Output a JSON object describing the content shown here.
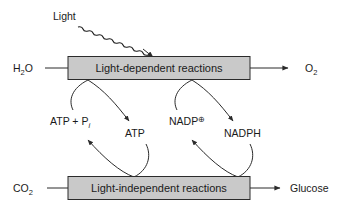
{
  "diagram": {
    "colors": {
      "box_fill": "#c9c9c9",
      "box_stroke": "#2b2b2b",
      "line": "#2b2b2b",
      "text": "#1a1a1a",
      "background": "#ffffff"
    },
    "light": {
      "label": "Light"
    },
    "boxes": [
      {
        "id": "light-dependent",
        "label": "Light-dependent reactions"
      },
      {
        "id": "light-independent",
        "label": "Light-independent reactions"
      }
    ],
    "inputs": [
      {
        "id": "water",
        "label_main": "H",
        "label_sub": "2",
        "label_tail": "O"
      },
      {
        "id": "carbon-dioxide",
        "label_main": "CO",
        "label_sub": "2",
        "label_tail": ""
      }
    ],
    "outputs": [
      {
        "id": "oxygen",
        "label_main": "O",
        "label_sub": "2",
        "label_tail": ""
      },
      {
        "id": "glucose",
        "label_main": "Glucose",
        "label_sub": "",
        "label_tail": ""
      }
    ],
    "cycles": [
      {
        "id": "atp-cycle",
        "product_label": "ATP",
        "reactant_main": "ATP + P",
        "reactant_sub": "i"
      },
      {
        "id": "nadph-cycle",
        "product_label": "NADPH",
        "reactant_main": "NADP",
        "reactant_sup": "⊕"
      }
    ]
  }
}
